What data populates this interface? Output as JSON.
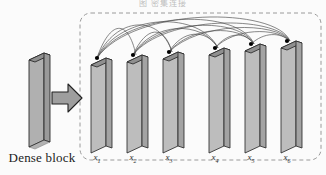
{
  "figure": {
    "caption_fragment": "图          密集连接",
    "dense_block_label": "Dense block",
    "type": "densenet-dense-block-diagram"
  },
  "colors": {
    "slab_face": "#b9b9b9",
    "slab_face_light": "#c9c9c9",
    "slab_top": "#8f8f8f",
    "slab_side": "#9c9c9c",
    "outline": "#2b2b2b",
    "arrow_fill": "#9e9e9e",
    "arrow_outline": "#222222",
    "dashed_border": "#9a9a9a",
    "arc_stroke": "#3a3a3a",
    "node_dot": "#000000",
    "background": "#fbfbfb",
    "text": "#1c1c1c"
  },
  "input_block": {
    "name": "dense-block-input-slab",
    "label": "Dense block"
  },
  "arrow": {
    "name": "flow-arrow",
    "direction": "right"
  },
  "dense_block": {
    "border_style": "dashed-rounded",
    "layer_count": 6,
    "layers": [
      {
        "id": "x1",
        "label": "x",
        "subscript": "1",
        "x": 97,
        "top": 58
      },
      {
        "id": "x2",
        "label": "x",
        "subscript": "2",
        "x": 133,
        "top": 55
      },
      {
        "id": "x3",
        "label": "x",
        "subscript": "3",
        "x": 169,
        "top": 52
      },
      {
        "id": "x4",
        "label": "x",
        "subscript": "4",
        "x": 215,
        "top": 48
      },
      {
        "id": "x5",
        "label": "x",
        "subscript": "5",
        "x": 251,
        "top": 44
      },
      {
        "id": "x6",
        "label": "x",
        "subscript": "6",
        "x": 287,
        "top": 41
      }
    ],
    "connections": [
      {
        "from": "x1",
        "to": "x2"
      },
      {
        "from": "x1",
        "to": "x3"
      },
      {
        "from": "x1",
        "to": "x4"
      },
      {
        "from": "x1",
        "to": "x5"
      },
      {
        "from": "x1",
        "to": "x6"
      },
      {
        "from": "x2",
        "to": "x3"
      },
      {
        "from": "x2",
        "to": "x4"
      },
      {
        "from": "x2",
        "to": "x5"
      },
      {
        "from": "x2",
        "to": "x6"
      },
      {
        "from": "x3",
        "to": "x4"
      },
      {
        "from": "x3",
        "to": "x5"
      },
      {
        "from": "x3",
        "to": "x6"
      },
      {
        "from": "x4",
        "to": "x5"
      },
      {
        "from": "x4",
        "to": "x6"
      },
      {
        "from": "x5",
        "to": "x6"
      }
    ]
  }
}
